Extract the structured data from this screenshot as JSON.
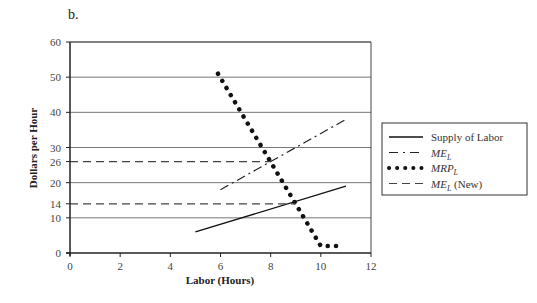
{
  "panel_label": "b.",
  "chart_data": {
    "type": "line",
    "title": "",
    "xlabel": "Labor (Hours)",
    "ylabel": "Dollars per Hour",
    "xlim": [
      0,
      12
    ],
    "ylim": [
      0,
      60
    ],
    "x_ticks": [
      0,
      2,
      4,
      6,
      8,
      10,
      12
    ],
    "y_ticks": [
      0,
      10,
      14,
      20,
      26,
      30,
      40,
      50,
      60
    ],
    "grid": "horizontal at 10, 20, 30, 40, 50, 60",
    "legend_position": "right",
    "series": [
      {
        "name": "Supply of Labor",
        "style": "solid",
        "points": [
          [
            5,
            6
          ],
          [
            11,
            19
          ]
        ]
      },
      {
        "name": "ME_L",
        "style": "dash-dot",
        "points": [
          [
            6,
            18
          ],
          [
            11,
            38
          ]
        ]
      },
      {
        "name": "MRP_L",
        "style": "dotted",
        "points": [
          [
            5.9,
            51
          ],
          [
            10,
            2
          ],
          [
            10.7,
            2
          ]
        ]
      },
      {
        "name": "ME_L (New)",
        "style": "dashed",
        "points": [
          [
            0,
            26
          ],
          [
            8,
            26
          ]
        ]
      },
      {
        "name": "ME_L (New)",
        "style": "dashed",
        "points": [
          [
            0,
            14
          ],
          [
            9,
            14
          ]
        ]
      }
    ]
  },
  "legend": {
    "items": [
      {
        "label": "Supply of Labor",
        "sub": ""
      },
      {
        "label": "ME",
        "sub": "L"
      },
      {
        "label": "MRP",
        "sub": "L"
      },
      {
        "label": "ME",
        "sub": "L",
        "suffix": " (New)"
      }
    ]
  }
}
